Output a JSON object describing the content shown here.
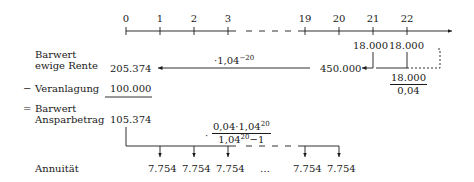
{
  "timeline": {
    "ticks": [
      "0",
      "1",
      "2",
      "3",
      "19",
      "20",
      "21",
      "22"
    ]
  },
  "labels": {
    "barwert_ewige_rente_line1": "Barwert",
    "barwert_ewige_rente_line2": "ewige Rente",
    "minus_sign": "−",
    "veranlagung": "Veranlagung",
    "equals_sign": "=",
    "barwert_ansparbetrag_line1": "Barwert",
    "barwert_ansparbetrag_line2": "Ansparbetrag",
    "annuitaet": "Annuität"
  },
  "values": {
    "barwert_ewige_rente": "205.374",
    "veranlagung": "100.000",
    "barwert_ansparbetrag": "105.374",
    "perpetuity_value": "450.000",
    "payment_21": "18.000",
    "payment_22": "18.000",
    "annuities": [
      "7.754",
      "7.754",
      "7.754",
      "…",
      "7.754",
      "7.754"
    ]
  },
  "formulas": {
    "discount_prefix": "·1,04",
    "discount_exp": "−20",
    "perpetuity_numerator": "18.000",
    "perpetuity_denominator": "0,04",
    "annuity_dot": "·",
    "annuity_num_a": "0,04·1,04",
    "annuity_num_exp": "20",
    "annuity_den_a": "1,04",
    "annuity_den_exp": "20",
    "annuity_den_b": "−1"
  }
}
